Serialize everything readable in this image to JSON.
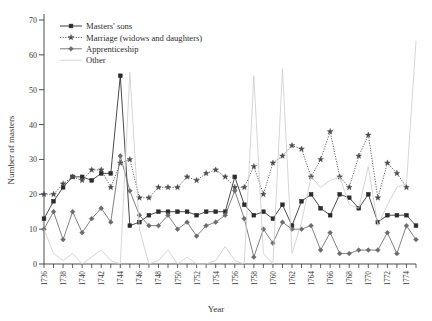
{
  "chart_data": {
    "type": "line",
    "title": "",
    "xlabel": "Year",
    "ylabel": "Number of masters",
    "xlim": [
      1736,
      1775
    ],
    "ylim": [
      0,
      70
    ],
    "ytick_step": 10,
    "yticks": [
      0,
      10,
      20,
      30,
      40,
      50,
      60,
      70
    ],
    "xticks": [
      1736,
      1737,
      1738,
      1739,
      1740,
      1741,
      1742,
      1743,
      1744,
      1745,
      1746,
      1747,
      1748,
      1749,
      1750,
      1751,
      1752,
      1753,
      1754,
      1755,
      1756,
      1757,
      1758,
      1759,
      1760,
      1761,
      1762,
      1763,
      1764,
      1765,
      1766,
      1767,
      1768,
      1769,
      1770,
      1771,
      1772,
      1773,
      1774,
      1775
    ],
    "xtick_labels": [
      "1736",
      "",
      "1738",
      "",
      "1740",
      "",
      "1742",
      "",
      "1744",
      "",
      "1746",
      "",
      "1748",
      "",
      "1750",
      "",
      "1752",
      "",
      "1754",
      "",
      "1756",
      "",
      "1758",
      "",
      "1760",
      "",
      "1762",
      "",
      "1764",
      "",
      "1766",
      "",
      "1768",
      "",
      "1770",
      "",
      "1772",
      "",
      "1774",
      ""
    ],
    "grid": false,
    "legend_position": "top-left",
    "x": [
      1736,
      1737,
      1738,
      1739,
      1740,
      1741,
      1742,
      1743,
      1744,
      1745,
      1746,
      1747,
      1748,
      1749,
      1750,
      1751,
      1752,
      1753,
      1754,
      1755,
      1756,
      1757,
      1758,
      1759,
      1760,
      1761,
      1762,
      1763,
      1764,
      1765,
      1766,
      1767,
      1768,
      1769,
      1770,
      1771,
      1772,
      1773,
      1774,
      1775
    ],
    "series": [
      {
        "name": "Masters' sons",
        "color": "#2b2b2b",
        "line_style": "solid",
        "marker": "filled-square",
        "values": [
          13,
          18,
          22,
          25,
          25,
          24,
          26,
          26,
          54,
          11,
          12,
          14,
          15,
          15,
          15,
          15,
          14,
          15,
          15,
          15,
          25,
          17,
          14,
          15,
          13,
          17,
          11,
          18,
          20,
          16,
          14,
          20,
          19,
          16,
          20,
          12,
          14,
          14,
          14,
          11
        ]
      },
      {
        "name": "Marriage (widows and daughters)",
        "color": "#4a4a4a",
        "line_style": "dotted",
        "marker": "star",
        "values": [
          20,
          20,
          23,
          25,
          24,
          27,
          27,
          22,
          29,
          30,
          19,
          19,
          22,
          22,
          22,
          25,
          24,
          26,
          27,
          25,
          22,
          22,
          28,
          20,
          29,
          31,
          34,
          33,
          25,
          30,
          38,
          25,
          22,
          31,
          37,
          19,
          29,
          26,
          22,
          null
        ]
      },
      {
        "name": "Apprenticeship",
        "color": "#6b6b6b",
        "line_style": "solid",
        "marker": "diamond",
        "values": [
          10,
          15,
          7,
          15,
          9,
          13,
          16,
          12,
          31,
          21,
          14,
          11,
          11,
          14,
          10,
          12,
          8,
          11,
          12,
          14,
          21,
          13,
          2,
          10,
          6,
          12,
          10,
          10,
          11,
          4,
          9,
          3,
          3,
          4,
          4,
          4,
          9,
          3,
          11,
          7
        ]
      },
      {
        "name": "Other",
        "color": "#cfcfcf",
        "line_style": "solid",
        "marker": "none",
        "values": [
          10,
          3,
          1,
          3,
          0,
          2,
          4,
          1,
          0,
          55,
          10,
          0,
          1,
          4,
          0,
          2,
          0,
          0,
          1,
          5,
          1,
          0,
          54,
          3,
          0,
          56,
          3,
          12,
          25,
          22,
          24,
          25,
          17,
          16,
          28,
          11,
          17,
          22,
          23,
          64
        ]
      }
    ]
  },
  "legend": {
    "items": [
      {
        "label": "Masters' sons"
      },
      {
        "label": "Marriage (widows and daughters)"
      },
      {
        "label": "Apprenticeship"
      },
      {
        "label": "Other"
      }
    ]
  }
}
